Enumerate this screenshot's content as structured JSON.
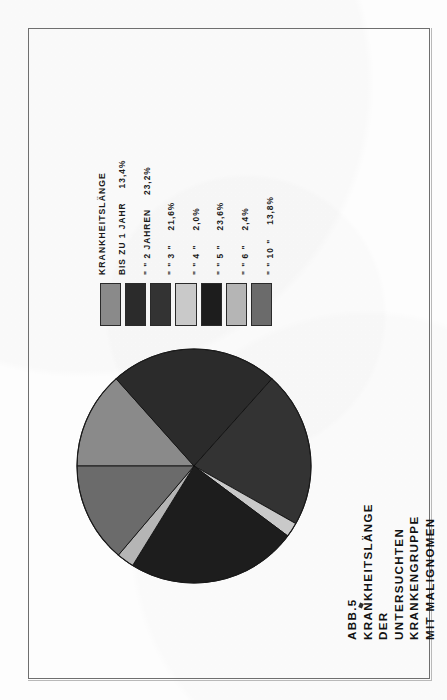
{
  "figure": {
    "caption_line1": "ABB.5   KRANKHEITSLÄNGE  DER  UNTERSUCHTEN",
    "caption_line2": "KRANKENGRUPPE  MIT  MALIGNOMEN",
    "legend_header": "KRANKHEITSLÄNGE"
  },
  "chart_data": {
    "type": "pie",
    "title": "ABB.5 KRANKHEITSLÄNGE DER UNTERSUCHTEN KRANKENGRUPPE MIT MALIGNOMEN",
    "xlabel": "",
    "ylabel": "",
    "legend_position": "top",
    "grid": false,
    "unit": "%",
    "categories": [
      "BIS ZU  1 JAHR",
      "  \"    \"    2 JAHREN",
      "  \"    \"    3     \"",
      "  \"    \"    4     \"",
      "  \"    \"    5     \"",
      "  \"    \"    6     \"",
      "  \"    \"   10     \""
    ],
    "value_labels": [
      "13,4%",
      "23,2%",
      "21,6%",
      "2,0%",
      "23,6%",
      "2,4%",
      "13,8%"
    ],
    "values": [
      13.4,
      23.2,
      21.6,
      2.0,
      23.6,
      2.4,
      13.8
    ],
    "colors": [
      "#8a8a8a",
      "#2b2b2b",
      "#333333",
      "#c9c9c9",
      "#1d1d1d",
      "#b5b5b5",
      "#6b6b6b"
    ],
    "rows": [
      {
        "cat": "BIS ZU  1 JAHR",
        "pct": "13,4%",
        "value": 13.4,
        "color": "#8a8a8a"
      },
      {
        "cat": "  \"    \"    2 JAHREN",
        "pct": "23,2%",
        "value": 23.2,
        "color": "#2b2b2b"
      },
      {
        "cat": "  \"    \"    3     \"",
        "pct": "21,6%",
        "value": 21.6,
        "color": "#333333"
      },
      {
        "cat": "  \"    \"    4     \"",
        "pct": "2,0%",
        "value": 2.0,
        "color": "#c9c9c9"
      },
      {
        "cat": "  \"    \"    5     \"",
        "pct": "23,6%",
        "value": 23.6,
        "color": "#1d1d1d"
      },
      {
        "cat": "  \"    \"    6     \"",
        "pct": "2,4%",
        "value": 2.4,
        "color": "#b5b5b5"
      },
      {
        "cat": "  \"    \"   10     \"",
        "pct": "13,8%",
        "value": 13.8,
        "color": "#6b6b6b"
      }
    ]
  }
}
